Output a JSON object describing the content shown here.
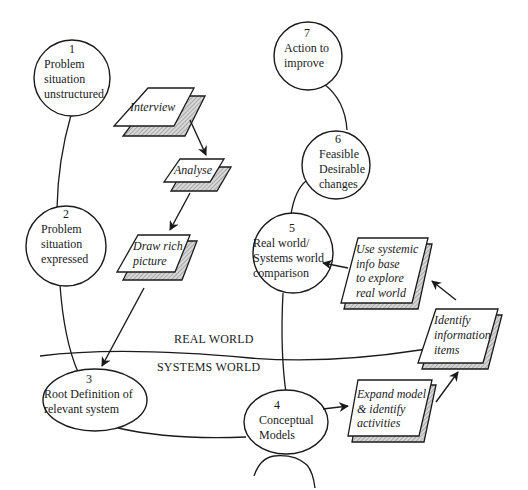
{
  "diagram": {
    "stages": [
      {
        "num": "1",
        "lines": [
          "Problem",
          "situation",
          "unstructured"
        ]
      },
      {
        "num": "2",
        "lines": [
          "Problem",
          "situation",
          "expressed"
        ]
      },
      {
        "num": "3",
        "lines": [
          "Root Definition of",
          "relevant system"
        ]
      },
      {
        "num": "4",
        "lines": [
          "Conceptual",
          "Models"
        ]
      },
      {
        "num": "5",
        "lines": [
          "Real world/",
          "Systems world",
          "comparison"
        ]
      },
      {
        "num": "6",
        "lines": [
          "Feasible",
          "Desirable",
          "changes"
        ]
      },
      {
        "num": "7",
        "lines": [
          "Action to",
          "improve"
        ]
      }
    ],
    "activities": [
      {
        "lines": [
          "Interview"
        ]
      },
      {
        "lines": [
          "Analyse"
        ]
      },
      {
        "lines": [
          "Draw rich",
          "picture"
        ]
      },
      {
        "lines": [
          "Use systemic",
          "info base",
          "to explore",
          "real world"
        ]
      },
      {
        "lines": [
          "Identify",
          "information",
          "items"
        ]
      },
      {
        "lines": [
          "Expand model",
          "& identify",
          "activities"
        ]
      }
    ],
    "divider": {
      "real_world": "REAL WORLD",
      "systems_world": "SYSTEMS WORLD"
    }
  }
}
